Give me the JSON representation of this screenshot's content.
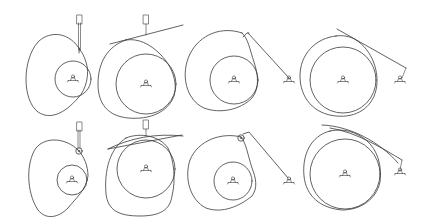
{
  "diagram": {
    "width": 428,
    "height": 224,
    "background": "#ffffff",
    "stroke_color": "#3a3a3a",
    "mechanisms": [
      {
        "id": "knife-edge-translating",
        "row": 0,
        "col": 0,
        "base_circle": {
          "cx": 73,
          "cy": 79,
          "r": 18
        },
        "pivot": {
          "x": 73,
          "y": 79
        },
        "cam_path": "M80 50 C 70 32, 50 30, 38 42 C 22 60, 22 100, 38 112 C 50 120, 64 114, 78 98 C 86 90, 90 74, 86 62 C 84 56, 82 52, 80 50 Z",
        "follower": {
          "type": "knife-edge-translating",
          "rod": [
            [
              80.5,
              50
            ],
            [
              80.5,
              23
            ]
          ],
          "rod2": [
            [
              78.5,
              50
            ],
            [
              78.5,
              23
            ]
          ],
          "guide": {
            "x": 77,
            "y": 15,
            "w": 5,
            "h": 9
          },
          "tip": [
            [
              79,
              53
            ],
            [
              79.5,
              48
            ]
          ]
        }
      },
      {
        "id": "flat-faced-translating",
        "row": 0,
        "col": 1,
        "base_circle": {
          "cx": 146,
          "cy": 84,
          "r": 30
        },
        "pivot": {
          "x": 146,
          "y": 84
        },
        "cam_path": "M126 40 C 108 46, 98 62, 98 84 C 98 104, 108 116, 128 118 C 150 120, 168 112, 174 96 C 178 82, 172 66, 160 54 C 150 44, 138 38, 126 40 Z",
        "follower": {
          "type": "flat-faced-translating",
          "face": [
            [
              110,
              44
            ],
            [
              183,
              25
            ]
          ],
          "rod": [
            [
              146,
              35
            ],
            [
              146,
              24
            ]
          ],
          "guide": {
            "x": 143.5,
            "y": 15,
            "w": 5,
            "h": 9
          }
        }
      },
      {
        "id": "knife-edge-oscillating",
        "row": 0,
        "col": 2,
        "base_circle": {
          "cx": 234,
          "cy": 80,
          "r": 24
        },
        "pivot": {
          "x": 234,
          "y": 80
        },
        "cam_path": "M242 33 C 222 26, 200 34, 190 54 C 180 74, 186 100, 204 108 C 220 114, 240 110, 252 98 C 260 88, 258 74, 254 62 C 250 50, 248 38, 242 33 Z",
        "follower": {
          "type": "knife-edge-oscillating",
          "arm": [
            [
              248,
              33
            ],
            [
              289,
              78
            ]
          ],
          "tip": [
            [
              243,
              37
            ],
            [
              247,
              33
            ],
            [
              249,
              33
            ]
          ],
          "arm_pivot": {
            "x": 289,
            "y": 80
          }
        }
      },
      {
        "id": "flat-faced-oscillating",
        "row": 0,
        "col": 3,
        "base_circle": {
          "cx": 343,
          "cy": 80,
          "r": 33
        },
        "pivot": {
          "x": 343,
          "y": 80
        },
        "cam_path": "M336 36 C 316 38, 300 54, 300 76 C 300 98, 314 114, 336 116 C 356 118, 372 108, 376 90 C 380 72, 372 50, 356 40 C 350 36, 342 35, 336 36 Z",
        "follower": {
          "type": "flat-faced-oscillating",
          "face": [
            [
              337,
              29
            ],
            [
              406,
              68
            ]
          ],
          "link": [
            [
              406,
              68
            ],
            [
              402,
              78
            ]
          ],
          "arm_pivot": {
            "x": 400,
            "y": 80
          }
        }
      },
      {
        "id": "roller-translating",
        "row": 1,
        "col": 0,
        "base_circle": {
          "cx": 72,
          "cy": 180,
          "r": 15
        },
        "pivot": {
          "x": 72,
          "y": 180
        },
        "cam_path": "M78 150 C 66 138, 46 136, 36 148 C 26 162, 26 192, 38 210 C 46 220, 58 218, 68 208 C 76 198, 86 190, 88 176 C 88 166, 84 156, 78 150 Z",
        "follower": {
          "type": "roller-translating",
          "roller": {
            "cx": 79,
            "cy": 151,
            "r": 3.2
          },
          "rod": [
            [
              78,
              148
            ],
            [
              78,
              130
            ]
          ],
          "rod2": [
            [
              80,
              148
            ],
            [
              80,
              130
            ]
          ],
          "guide": {
            "x": 77,
            "y": 122,
            "w": 5,
            "h": 9
          }
        }
      },
      {
        "id": "flat-faced-translating-2",
        "row": 1,
        "col": 1,
        "base_circle": {
          "cx": 146,
          "cy": 169,
          "r": 29
        },
        "pivot": {
          "x": 146,
          "y": 169
        },
        "cam_path": "M126 138 C 110 148, 104 170, 106 194 C 108 210, 118 216, 140 216 C 160 216, 170 210, 172 196 C 176 180, 174 160, 168 148 C 160 136, 140 132, 126 138 Z",
        "follower": {
          "type": "flat-faced-translating",
          "face": [
            [
              108,
              149
            ],
            [
              182,
              135
            ]
          ],
          "face_curve": "M108 149 C 130 138, 156 133, 183 136",
          "rod": [
            [
              146,
              136
            ],
            [
              146,
              129
            ]
          ],
          "guide": {
            "x": 143.5,
            "y": 120,
            "w": 5,
            "h": 9
          }
        }
      },
      {
        "id": "roller-oscillating",
        "row": 1,
        "col": 2,
        "base_circle": {
          "cx": 233,
          "cy": 181,
          "r": 19
        },
        "pivot": {
          "x": 233,
          "y": 181
        },
        "cam_path": "M241 137 C 222 132, 198 140, 190 160 C 184 178, 190 200, 206 208 C 222 214, 240 206, 252 196 C 258 188, 256 178, 252 168 C 248 156, 246 142, 241 137 Z",
        "follower": {
          "type": "roller-oscillating",
          "roller": {
            "cx": 241,
            "cy": 138,
            "r": 3.2
          },
          "arm": [
            [
              243,
              134
            ],
            [
              249,
              132
            ],
            [
              288,
              178
            ]
          ],
          "arm_pivot": {
            "x": 289,
            "y": 181
          }
        }
      },
      {
        "id": "flat-faced-oscillating-2",
        "row": 1,
        "col": 3,
        "base_circle": {
          "cx": 345,
          "cy": 174,
          "r": 35
        },
        "pivot": {
          "x": 345,
          "y": 174
        },
        "cam_path": "M330 131 C 310 136, 302 156, 304 176 C 306 196, 320 208, 342 210 C 360 210, 376 200, 380 182 C 382 166, 378 150, 366 140 C 356 132, 344 128, 330 131 Z",
        "follower": {
          "type": "flat-faced-oscillating",
          "face_curve": "M322 125 C 350 126, 380 142, 398 163",
          "face_curve2": "M330 128 C 356 132, 382 148, 402 160",
          "link": [
            [
              402,
              160
            ],
            [
              400,
              170
            ]
          ],
          "arm_pivot": {
            "x": 400,
            "y": 172
          }
        }
      }
    ]
  }
}
